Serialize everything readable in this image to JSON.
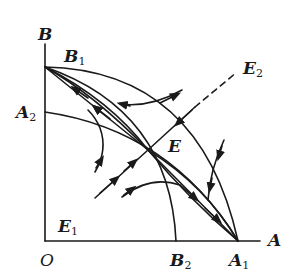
{
  "diagram": {
    "type": "phase-portrait",
    "axes": {
      "x_label": "A",
      "y_label": "B",
      "origin_label": "O"
    },
    "points": [
      {
        "id": "B1",
        "base": "B",
        "sub": "1",
        "description": "intercept on B axis"
      },
      {
        "id": "A2",
        "base": "A",
        "sub": "2",
        "description": "intercept on B axis"
      },
      {
        "id": "A1",
        "base": "A",
        "sub": "1",
        "description": "intercept on A axis"
      },
      {
        "id": "B2",
        "base": "B",
        "sub": "2",
        "description": "intercept on A axis"
      },
      {
        "id": "E",
        "base": "E",
        "sub": "",
        "description": "interior saddle equilibrium"
      },
      {
        "id": "E1",
        "base": "E",
        "sub": "1",
        "description": "origin equilibrium"
      },
      {
        "id": "E2",
        "base": "E",
        "sub": "2",
        "description": "separatrix direction label"
      }
    ],
    "curves": [
      "isocline A: A2 to A1",
      "isocline B: B1 to B2",
      "separatrix through E from E1 toward E2 (dashed beyond)",
      "trajectories flowing into E along stable manifold",
      "trajectories flowing from E toward B1 and A1 along unstable manifold"
    ],
    "stroke_color": "#1a1a1a"
  }
}
